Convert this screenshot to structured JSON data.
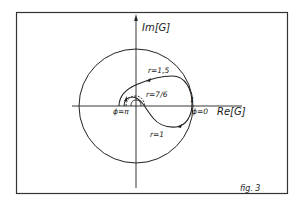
{
  "figure": {
    "caption": "fig. 3",
    "axes": {
      "y_label": "Im[G]",
      "x_label": "Re[G]"
    },
    "unit_circle_label": "1",
    "curve_labels": {
      "r_outer": "r=1,5",
      "r_inner": "r=7/6",
      "r_unit": "r=1"
    },
    "angle_labels": {
      "phi_pi": "ϕ=π",
      "phi_zero": "ϕ=0"
    },
    "colors": {
      "ink": "#1a1a1a",
      "background": "#ffffff"
    }
  }
}
